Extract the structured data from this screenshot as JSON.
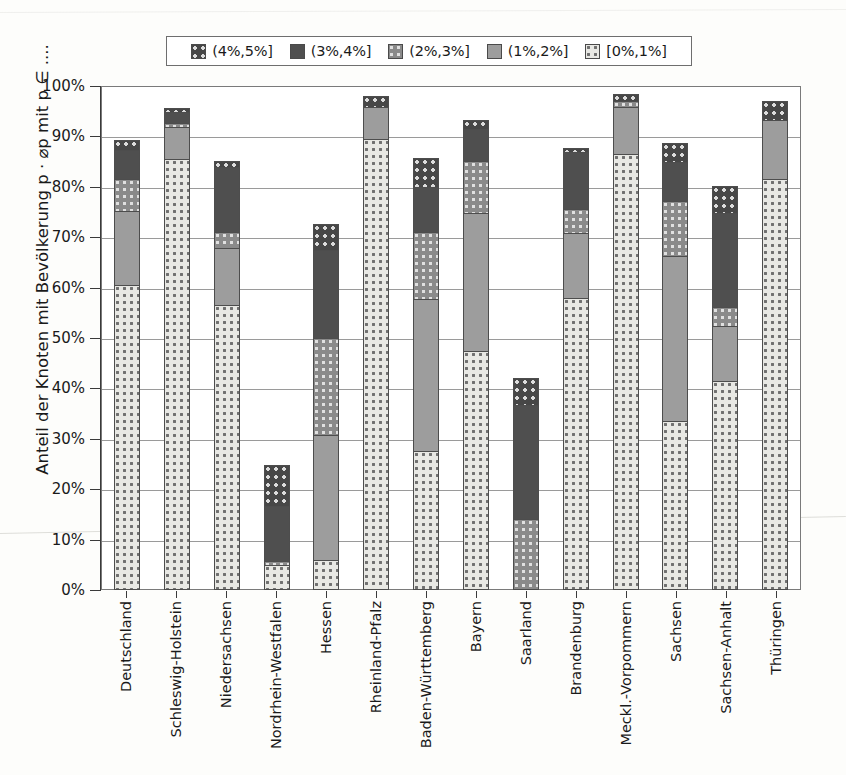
{
  "chart_data": {
    "type": "bar",
    "subtype": "stacked-bar",
    "title": "",
    "xlabel": "",
    "ylabel": "Anteil der Knoten mit Bevölkerung p · ⌀p mit p ∈ ....",
    "ylim": [
      0,
      100
    ],
    "ytick_labels": [
      "0%",
      "10%",
      "20%",
      "30%",
      "40%",
      "50%",
      "60%",
      "70%",
      "80%",
      "90%",
      "100%"
    ],
    "ytick_values": [
      0,
      10,
      20,
      30,
      40,
      50,
      60,
      70,
      80,
      90,
      100
    ],
    "grid": true,
    "legend_position": "top",
    "categories": [
      "Deutschland",
      "Schleswig-Holstein",
      "Niedersachsen",
      "Nordrhein-Westfalen",
      "Hessen",
      "Rheinland-Pfalz",
      "Baden-Württemberg",
      "Bayern",
      "Saarland",
      "Brandenburg",
      "Meckl.-Vorpommern",
      "Sachsen",
      "Sachsen-Anhalt",
      "Thüringen"
    ],
    "series": [
      {
        "name": "[0%,1%]",
        "swatch": "light-dotted",
        "color": "#e8e8e4",
        "values": [
          60.5,
          85.5,
          56.5,
          5.0,
          6.0,
          89.5,
          27.5,
          47.5,
          0.0,
          58.0,
          86.5,
          33.5,
          41.5,
          81.5
        ]
      },
      {
        "name": "(1%,2%]",
        "swatch": "solid-mid-grey",
        "color": "#9d9d9d",
        "values": [
          15.0,
          6.5,
          11.5,
          0.0,
          25.0,
          6.5,
          30.5,
          27.5,
          0.0,
          13.0,
          9.5,
          33.0,
          11.0,
          12.0
        ]
      },
      {
        "name": "(2%,3%]",
        "swatch": "mid-dotted",
        "color": "#8a8a8a",
        "values": [
          6.5,
          1.0,
          3.5,
          1.0,
          19.5,
          0.0,
          13.5,
          10.5,
          14.0,
          5.0,
          1.5,
          11.0,
          4.0,
          0.0
        ]
      },
      {
        "name": "(3%,4%]",
        "swatch": "solid-dark-grey",
        "color": "#4f4f4f",
        "values": [
          6.0,
          2.5,
          13.0,
          11.0,
          17.5,
          0.0,
          9.0,
          6.5,
          23.0,
          11.5,
          0.0,
          8.0,
          19.0,
          0.0
        ]
      },
      {
        "name": "(4%,5%]",
        "swatch": "dark-dotted",
        "color": "#474747",
        "values": [
          2.0,
          1.0,
          1.5,
          8.5,
          5.5,
          2.5,
          6.0,
          2.0,
          5.5,
          1.0,
          1.5,
          4.0,
          5.5,
          4.0
        ]
      }
    ],
    "totals": [
      90.0,
      96.5,
      86.0,
      25.5,
      73.5,
      98.5,
      86.5,
      94.0,
      42.5,
      88.5,
      99.0,
      89.5,
      81.0,
      97.5
    ]
  },
  "legend": {
    "items": [
      {
        "label": "(4%,5%]",
        "swatch": "dark-dotted"
      },
      {
        "label": "(3%,4%]",
        "swatch": "solid-dark-grey"
      },
      {
        "label": "(2%,3%]",
        "swatch": "mid-dotted"
      },
      {
        "label": "(1%,2%]",
        "swatch": "solid-mid-grey"
      },
      {
        "label": "[0%,1%]",
        "swatch": "light-dotted"
      }
    ]
  },
  "colors": {
    "light_dotted_bg": "#e8e8e4",
    "light_dotted_dot": "#707070",
    "mid_grey": "#9d9d9d",
    "mid_dotted_bg": "#8a8a8a",
    "mid_dotted_dot": "#e0e0e0",
    "dark_grey": "#4f4f4f",
    "dark_dotted_bg": "#474747",
    "dark_dotted_dot": "#dcdcdc",
    "outline": "#4d4d4d",
    "gridline": "#9a9a9a",
    "axis": "#3a3a3a"
  }
}
